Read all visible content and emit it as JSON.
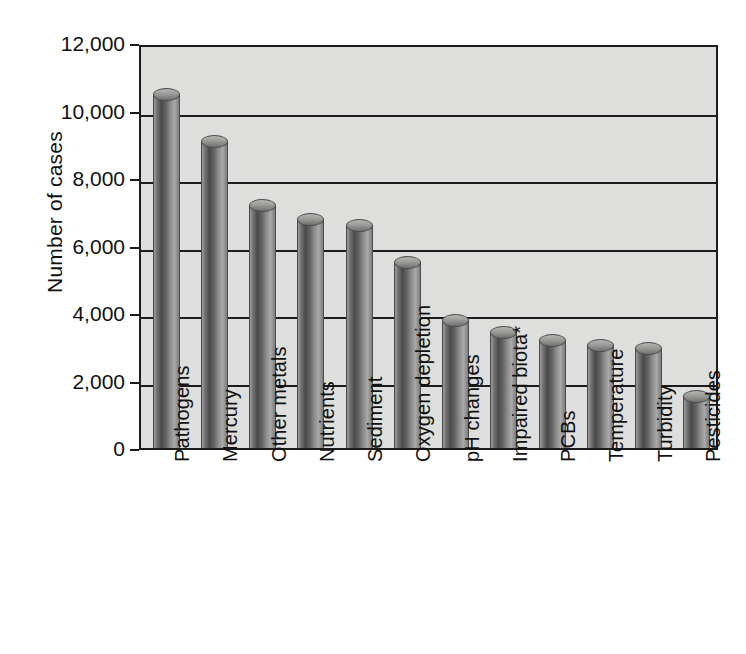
{
  "chart_data": {
    "type": "bar",
    "title": "",
    "xlabel": "",
    "ylabel": "Number of cases",
    "ylim": [
      0,
      12000
    ],
    "ytick_values": [
      0,
      2000,
      4000,
      6000,
      8000,
      10000,
      12000
    ],
    "ytick_labels": [
      "0",
      "2,000",
      "4,000",
      "6,000",
      "8,000",
      "10,000",
      "12,000"
    ],
    "grid": true,
    "legend": "none",
    "categories": [
      "Pathogens",
      "Mercury",
      "Other metals",
      "Nutrients",
      "Sediment",
      "Oxygen depletion",
      "pH changes",
      "Impaired biota*",
      "PCBs",
      "Temperature",
      "Turbidity",
      "Pesticides"
    ],
    "values": [
      10500,
      9100,
      7200,
      6800,
      6600,
      5500,
      3800,
      3450,
      3200,
      3050,
      2950,
      1550
    ],
    "bar_style": "cylinder",
    "colors": {
      "plot_background": "#dededc",
      "axis": "#1c1c1c",
      "bar_light": "#a9a9a9",
      "bar_dark": "#4a4a4a",
      "page_background": "#ffffff"
    },
    "footnote_marker": "*"
  }
}
